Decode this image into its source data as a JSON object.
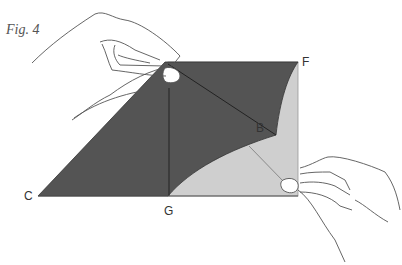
{
  "figure": {
    "caption": "Fig. 4",
    "labels": {
      "F": "F",
      "B": "B",
      "C": "C",
      "G": "G"
    },
    "colors": {
      "dark_paper": "#545454",
      "light_paper": "#cfcfcf",
      "crease": "#222222",
      "hand_outline": "#555555"
    }
  }
}
